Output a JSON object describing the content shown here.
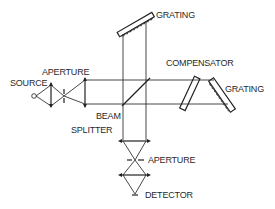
{
  "diagram": {
    "type": "optical-schematic",
    "labels": {
      "source": "SOURCE",
      "aperture_input": "APERTURE",
      "grating_top": "GRATING",
      "compensator": "COMPENSATOR",
      "grating_right": "GRATING",
      "beam": "BEAM",
      "splitter": "SPLITTER",
      "aperture_output": "APERTURE",
      "detector": "DETECTOR"
    },
    "components": [
      {
        "id": "source",
        "label": "SOURCE"
      },
      {
        "id": "input-lens-1",
        "label": ""
      },
      {
        "id": "input-aperture",
        "label": "APERTURE"
      },
      {
        "id": "collimating-lens",
        "label": ""
      },
      {
        "id": "beam-splitter",
        "label": "BEAM SPLITTER"
      },
      {
        "id": "grating-top",
        "label": "GRATING"
      },
      {
        "id": "compensator",
        "label": "COMPENSATOR"
      },
      {
        "id": "grating-right",
        "label": "GRATING"
      },
      {
        "id": "output-lens-1",
        "label": ""
      },
      {
        "id": "output-aperture",
        "label": "APERTURE"
      },
      {
        "id": "output-lens-2",
        "label": ""
      },
      {
        "id": "detector",
        "label": "DETECTOR"
      }
    ],
    "colors": {
      "line": "#333333",
      "background": "#ffffff"
    }
  }
}
